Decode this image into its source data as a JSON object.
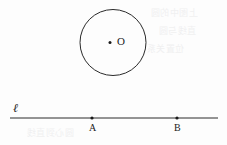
{
  "figure": {
    "type": "geometry-diagram",
    "background_color": "#fdfdfd",
    "ink_color": "#1b1b1b",
    "width": 227,
    "height": 145
  },
  "circle": {
    "name": "circle-O",
    "center_x": 113,
    "center_y": 42.5,
    "radius": 33,
    "stroke_color": "#2a2a2a",
    "stroke_width": 1,
    "fill": "none",
    "center_label": "O",
    "center_label_x": 117,
    "center_label_y": 37,
    "center_dot_x": 110,
    "center_dot_y": 42.5,
    "center_dot_radius": 1.5
  },
  "line": {
    "name": "line-l",
    "label": "ℓ",
    "label_x": 13,
    "label_y": 103,
    "x1": 10,
    "y1": 118,
    "x2": 218,
    "y2": 118,
    "stroke_color": "#2a2a2a",
    "stroke_width": 1
  },
  "points": [
    {
      "label": "A",
      "x": 92,
      "y": 118,
      "dot_radius": 1.6,
      "label_x": 89,
      "label_y": 123
    },
    {
      "label": "B",
      "x": 177,
      "y": 118,
      "dot_radius": 1.6,
      "label_x": 174,
      "label_y": 123
    }
  ],
  "bleed_through": [
    {
      "text": "上图中的圆",
      "x": 150,
      "y": 12
    },
    {
      "text": "直线与圆",
      "x": 158,
      "y": 30
    },
    {
      "text": "位置关系",
      "x": 146,
      "y": 48
    },
    {
      "text": "圆心到直线",
      "x": 26,
      "y": 128
    }
  ]
}
